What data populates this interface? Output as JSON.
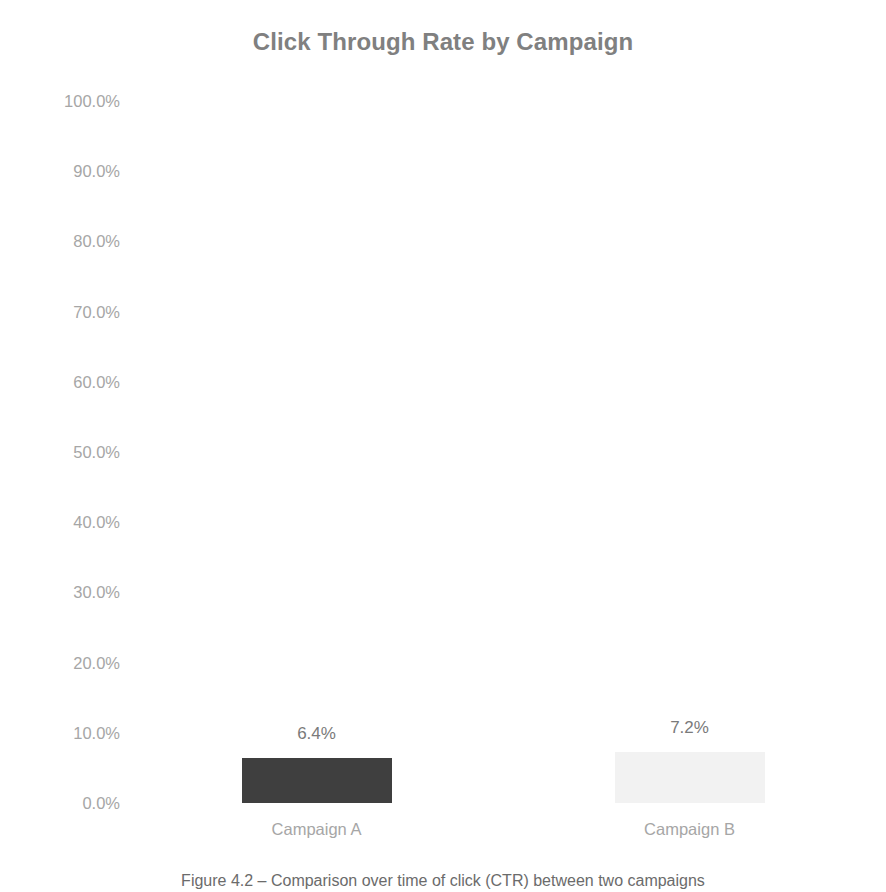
{
  "chart_data": {
    "type": "bar",
    "title": "Click Through Rate by Campaign",
    "categories": [
      "Campaign A",
      "Campaign B"
    ],
    "values": [
      6.4,
      7.2
    ],
    "value_labels": [
      "6.4%",
      "7.2%"
    ],
    "bar_colors": [
      "#3f3f3f",
      "#f2f2f2"
    ],
    "xlabel": "",
    "ylabel": "",
    "ylim": [
      0,
      100
    ],
    "ytick_labels": [
      "100.0%",
      "90.0%",
      "80.0%",
      "70.0%",
      "60.0%",
      "50.0%",
      "40.0%",
      "30.0%",
      "20.0%",
      "10.0%",
      "0.0%"
    ],
    "ytick_values": [
      100,
      90,
      80,
      70,
      60,
      50,
      40,
      30,
      20,
      10,
      0
    ],
    "grid": false,
    "legend": "none",
    "units": "percent"
  },
  "caption": {
    "text": "Figure 4.2 – Comparison over time of click (CTR) between two campaigns"
  },
  "colors": {
    "title": "#808080",
    "tick_label": "#a6a6a6",
    "value_label": "#7a7a7a",
    "background": "#ffffff",
    "bar_a": "#3f3f3f",
    "bar_b": "#f2f2f2"
  }
}
